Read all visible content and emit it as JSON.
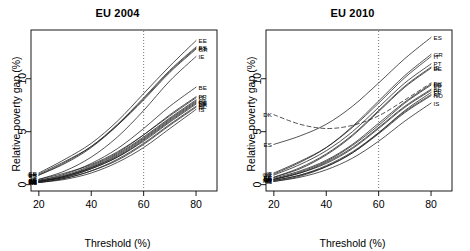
{
  "figure": {
    "kind": "two-panel-line-chart",
    "background": "#ffffff",
    "ink": "#000000"
  },
  "panels": [
    {
      "id": "eu2004",
      "title": "EU 2004"
    },
    {
      "id": "eu2010",
      "title": "EU 2010"
    }
  ],
  "axes": {
    "xlabel": "Threshold (%)",
    "ylabel": "Relative poverty gap (%)",
    "xticks": [
      "20",
      "40",
      "60",
      "80"
    ],
    "xtick_values": [
      20,
      40,
      60,
      80
    ],
    "yticks": [
      "0",
      "5",
      "10"
    ],
    "ytick_values": [
      0,
      5,
      10
    ],
    "xlim": [
      17,
      88
    ],
    "ylim": [
      -0.6,
      14.6
    ],
    "reference_line": {
      "x": 60,
      "style": "dotted"
    }
  },
  "chart_data": {
    "type": "line",
    "xlabel": "Threshold (%)",
    "ylabel": "Relative poverty gap (%)",
    "xlim": [
      17,
      88
    ],
    "ylim": [
      -0.6,
      14.6
    ],
    "grid": false,
    "legend": "inline-end-labels",
    "annotations": [
      {
        "panel": "eu2004",
        "text": "vertical dotted line at threshold = 60"
      },
      {
        "panel": "eu2010",
        "text": "vertical dotted line at threshold = 60"
      },
      {
        "panel": "eu2010",
        "text": "DK drawn as a dashed curve that dips then rises"
      }
    ],
    "panels": [
      {
        "name": "EU 2004",
        "x": [
          20,
          30,
          40,
          50,
          60,
          70,
          80
        ],
        "series": [
          {
            "name": "EE",
            "label_left": "EE",
            "label_right": "EE",
            "values": [
              1.1,
              2.4,
              3.9,
              6.0,
              8.6,
              11.2,
              13.6
            ]
          },
          {
            "name": "ES",
            "label_left": "ES",
            "label_right": "ES",
            "values": [
              0.9,
              2.1,
              3.6,
              5.7,
              8.2,
              10.8,
              13.0
            ]
          },
          {
            "name": "PT",
            "label_left": "PT",
            "label_right": "PT",
            "values": [
              0.9,
              2.0,
              3.5,
              5.6,
              8.1,
              10.7,
              12.9
            ]
          },
          {
            "name": "GR",
            "label_left": "GR",
            "label_right": "GR",
            "values": [
              1.0,
              2.2,
              3.6,
              5.6,
              8.0,
              10.6,
              12.8
            ]
          },
          {
            "name": "IE",
            "label_left": "IE",
            "label_right": "IE",
            "values": [
              0.5,
              1.3,
              2.6,
              4.5,
              7.0,
              9.8,
              12.1
            ]
          },
          {
            "name": "BE",
            "label_left": "BE",
            "label_right": "BE",
            "values": [
              0.4,
              1.0,
              2.0,
              3.4,
              5.3,
              7.4,
              9.2
            ]
          },
          {
            "name": "FR",
            "label_left": "FR",
            "label_right": "FR",
            "values": [
              0.4,
              0.9,
              1.8,
              3.0,
              4.7,
              6.6,
              8.3
            ]
          },
          {
            "name": "IT",
            "label_left": "IT",
            "label_right": "IT",
            "values": [
              0.5,
              1.1,
              1.9,
              3.1,
              4.7,
              6.5,
              8.2
            ]
          },
          {
            "name": "AT",
            "label_left": "AT",
            "label_right": "AT",
            "values": [
              0.3,
              0.8,
              1.7,
              2.9,
              4.5,
              6.3,
              8.0
            ]
          },
          {
            "name": "LU",
            "label_left": "LU",
            "label_right": "LU",
            "values": [
              0.3,
              0.8,
              1.6,
              2.8,
              4.4,
              6.2,
              7.9
            ]
          },
          {
            "name": "DE",
            "label_left": "DE",
            "label_right": "DE",
            "values": [
              0.3,
              0.8,
              1.6,
              2.7,
              4.3,
              6.1,
              7.8
            ]
          },
          {
            "name": "SE",
            "label_left": "SE",
            "label_right": "SE",
            "values": [
              0.3,
              0.7,
              1.5,
              2.6,
              4.2,
              6.0,
              7.7
            ]
          },
          {
            "name": "DK",
            "label_left": "DK",
            "label_right": "DK",
            "values": [
              0.3,
              0.7,
              1.5,
              2.6,
              4.1,
              5.9,
              7.6
            ]
          },
          {
            "name": "NL",
            "label_left": "NL",
            "label_right": "NL",
            "values": [
              0.2,
              0.6,
              1.3,
              2.4,
              3.9,
              5.7,
              7.4
            ]
          },
          {
            "name": "FI",
            "label_left": "FI",
            "label_right": "FI",
            "values": [
              0.2,
              0.6,
              1.3,
              2.3,
              3.8,
              5.6,
              7.3
            ]
          },
          {
            "name": "IS",
            "label_left": "IS",
            "label_right": "IS",
            "values": [
              0.2,
              0.5,
              1.1,
              2.1,
              3.5,
              5.3,
              7.1
            ]
          }
        ]
      },
      {
        "name": "EU 2010",
        "x": [
          20,
          30,
          40,
          50,
          60,
          70,
          80
        ],
        "series": [
          {
            "name": "ES",
            "label_left": "ES",
            "label_right": "ES",
            "values": [
              3.8,
              4.6,
              5.7,
              7.4,
              9.6,
              11.9,
              13.9
            ]
          },
          {
            "name": "GR",
            "label_left": "GR",
            "label_right": "GR",
            "values": [
              1.0,
              2.1,
              3.5,
              5.5,
              7.9,
              10.3,
              12.3
            ]
          },
          {
            "name": "IT",
            "label_left": "IT",
            "label_right": "IT",
            "values": [
              1.1,
              2.2,
              3.5,
              5.4,
              7.7,
              10.1,
              12.1
            ]
          },
          {
            "name": "PT",
            "label_left": "PT",
            "label_right": "PT",
            "values": [
              0.9,
              1.9,
              3.2,
              5.0,
              7.3,
              9.6,
              11.4
            ]
          },
          {
            "name": "IE",
            "label_left": "IE",
            "label_right": "IE",
            "values": [
              0.7,
              1.6,
              2.9,
              4.7,
              7.0,
              9.3,
              11.1
            ]
          },
          {
            "name": "EE",
            "label_left": "EE",
            "label_right": "EE",
            "values": [
              0.7,
              1.5,
              2.8,
              4.6,
              6.9,
              9.2,
              11.0
            ]
          },
          {
            "name": "DK",
            "label_left": "DK",
            "label_right": "DK",
            "values": [
              6.6,
              5.7,
              5.3,
              5.6,
              6.5,
              8.0,
              9.6
            ],
            "style": "dashed"
          },
          {
            "name": "BE",
            "label_left": "BE",
            "label_right": "BE",
            "values": [
              0.6,
              1.3,
              2.3,
              3.8,
              5.8,
              7.8,
              9.5
            ]
          },
          {
            "name": "LU",
            "label_left": "LU",
            "label_right": "LU",
            "values": [
              0.5,
              1.2,
              2.2,
              3.7,
              5.6,
              7.7,
              9.4
            ]
          },
          {
            "name": "SI",
            "label_left": "SI",
            "label_right": "SI",
            "values": [
              0.5,
              1.1,
              2.1,
              3.5,
              5.4,
              7.4,
              9.0
            ]
          },
          {
            "name": "FR",
            "label_left": "FR",
            "label_right": "FR",
            "values": [
              0.5,
              1.1,
              2.0,
              3.4,
              5.3,
              7.3,
              8.9
            ]
          },
          {
            "name": "AT",
            "label_left": "AT",
            "label_right": "AT",
            "values": [
              0.4,
              0.9,
              1.8,
              3.1,
              4.9,
              6.9,
              8.5
            ]
          },
          {
            "name": "NO",
            "label_left": "NO",
            "label_right": "NO",
            "values": [
              0.4,
              0.9,
              1.7,
              3.0,
              4.8,
              6.8,
              8.4
            ]
          },
          {
            "name": "FI",
            "label_left": "FI",
            "label_right": "FI",
            "values": [
              0.3,
              0.8,
              1.7,
              3.0,
              4.9,
              7.0,
              8.7
            ]
          },
          {
            "name": "IS",
            "label_left": "IS",
            "label_right": "IS",
            "values": [
              0.3,
              0.7,
              1.4,
              2.5,
              4.1,
              6.0,
              7.7
            ]
          }
        ]
      }
    ]
  }
}
